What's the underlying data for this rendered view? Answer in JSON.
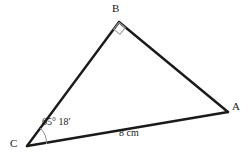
{
  "figure": {
    "type": "triangle-diagram",
    "background_color": "#ffffff",
    "stroke_color": "#1a1a1a",
    "mark_color": "#8c8c8c",
    "vertices": {
      "A": {
        "label": "A",
        "x": 228,
        "y": 112
      },
      "B": {
        "label": "B",
        "x": 119,
        "y": 22
      },
      "C": {
        "label": "C",
        "x": 27,
        "y": 146
      }
    },
    "angles": {
      "at_B": {
        "label": "",
        "marker": "right-angle-square",
        "value": "90°"
      },
      "at_C": {
        "label": "65° 18'",
        "marker": "arc"
      }
    },
    "sides": {
      "CA": {
        "label": "8 cm"
      },
      "CB": {
        "label": ""
      },
      "BA": {
        "label": ""
      }
    }
  }
}
